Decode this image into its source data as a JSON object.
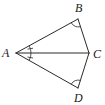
{
  "diagram": {
    "type": "geometry",
    "points": {
      "A": {
        "x": 16,
        "y": 53,
        "label": "A"
      },
      "B": {
        "x": 78,
        "y": 19,
        "label": "B"
      },
      "C": {
        "x": 89,
        "y": 53,
        "label": "C"
      },
      "D": {
        "x": 78,
        "y": 88,
        "label": "D"
      }
    },
    "segments": [
      "AB",
      "AC",
      "AD",
      "BC",
      "CD"
    ],
    "angle_marks": [
      {
        "vertex": "A",
        "between": "AB-AC",
        "style": "arc-with-tick"
      },
      {
        "vertex": "A",
        "between": "AC-AD",
        "style": "arc-with-tick"
      },
      {
        "vertex": "B",
        "style": "arc"
      },
      {
        "vertex": "D",
        "style": "arc"
      }
    ],
    "colors": {
      "stroke": "#2a2a2a",
      "background": "#ffffff",
      "text": "#1a1a1a"
    }
  }
}
